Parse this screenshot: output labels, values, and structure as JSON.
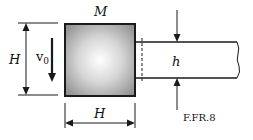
{
  "figure": {
    "caption": "F.FR.8",
    "block": {
      "mass_label": "M",
      "height_label": "H",
      "width_label": "H",
      "velocity_label": "v",
      "velocity_subscript": "0"
    },
    "plate": {
      "thickness_label": "h"
    },
    "colors": {
      "stroke": "#1a1a1a",
      "block_center": "#ffffff",
      "block_edge": "#8c8c8c"
    }
  }
}
